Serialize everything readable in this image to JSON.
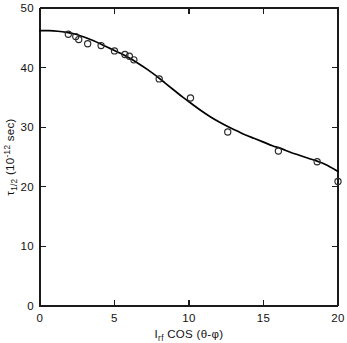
{
  "chart_data": {
    "type": "scatter",
    "title": "",
    "xlabel": "I_rf COS (θ-φ)",
    "xlabel_parts": {
      "main1": "I",
      "sub1": "rf",
      "main2": " COS (θ-φ)"
    },
    "ylabel": "τ_1/2 (10^-12 sec)",
    "ylabel_parts": {
      "main1": "τ",
      "sub1": "1/2",
      "main2": " (10",
      "sup1": "-12",
      "main3": " sec)"
    },
    "xlim": [
      0,
      20
    ],
    "ylim": [
      0,
      50
    ],
    "xticks": [
      0,
      5,
      10,
      15,
      20
    ],
    "xtick_labels": [
      "0",
      "5",
      "10",
      "15",
      "20"
    ],
    "yticks": [
      0,
      10,
      20,
      30,
      40,
      50
    ],
    "ytick_labels": [
      "0",
      "10",
      "20",
      "30",
      "40",
      "50"
    ],
    "grid": false,
    "legend": false,
    "axis_color": "#1a1a1a",
    "curve_color": "#000000",
    "marker_color": "#2b2b2b",
    "marker": "open-circle",
    "series": [
      {
        "name": "measured",
        "type": "scatter",
        "points": [
          {
            "x": 1.9,
            "y": 45.6
          },
          {
            "x": 2.4,
            "y": 45.2
          },
          {
            "x": 2.6,
            "y": 44.7
          },
          {
            "x": 3.2,
            "y": 44.0
          },
          {
            "x": 4.1,
            "y": 43.7
          },
          {
            "x": 5.0,
            "y": 42.8
          },
          {
            "x": 5.7,
            "y": 42.2
          },
          {
            "x": 6.0,
            "y": 41.9
          },
          {
            "x": 6.3,
            "y": 41.3
          },
          {
            "x": 8.0,
            "y": 38.1
          },
          {
            "x": 10.1,
            "y": 34.9
          },
          {
            "x": 12.6,
            "y": 29.2
          },
          {
            "x": 16.0,
            "y": 26.0
          },
          {
            "x": 18.6,
            "y": 24.2
          },
          {
            "x": 20.0,
            "y": 20.9
          }
        ]
      },
      {
        "name": "fit",
        "type": "line",
        "points": [
          {
            "x": 0.0,
            "y": 46.2
          },
          {
            "x": 0.6,
            "y": 46.2
          },
          {
            "x": 1.2,
            "y": 46.1
          },
          {
            "x": 1.8,
            "y": 45.9
          },
          {
            "x": 2.4,
            "y": 45.6
          },
          {
            "x": 3.0,
            "y": 45.1
          },
          {
            "x": 3.6,
            "y": 44.5
          },
          {
            "x": 4.2,
            "y": 43.8
          },
          {
            "x": 4.8,
            "y": 43.1
          },
          {
            "x": 5.4,
            "y": 42.4
          },
          {
            "x": 6.0,
            "y": 41.6
          },
          {
            "x": 6.6,
            "y": 40.7
          },
          {
            "x": 7.2,
            "y": 39.7
          },
          {
            "x": 7.8,
            "y": 38.6
          },
          {
            "x": 8.4,
            "y": 37.4
          },
          {
            "x": 9.0,
            "y": 36.2
          },
          {
            "x": 9.6,
            "y": 35.0
          },
          {
            "x": 10.2,
            "y": 33.9
          },
          {
            "x": 10.8,
            "y": 32.8
          },
          {
            "x": 11.4,
            "y": 31.8
          },
          {
            "x": 12.0,
            "y": 30.9
          },
          {
            "x": 12.6,
            "y": 30.1
          },
          {
            "x": 13.2,
            "y": 29.4
          },
          {
            "x": 13.8,
            "y": 28.7
          },
          {
            "x": 14.4,
            "y": 28.1
          },
          {
            "x": 15.0,
            "y": 27.5
          },
          {
            "x": 15.6,
            "y": 26.9
          },
          {
            "x": 16.2,
            "y": 26.4
          },
          {
            "x": 16.8,
            "y": 25.8
          },
          {
            "x": 17.4,
            "y": 25.3
          },
          {
            "x": 18.0,
            "y": 24.8
          },
          {
            "x": 18.6,
            "y": 24.3
          },
          {
            "x": 19.2,
            "y": 23.7
          },
          {
            "x": 20.0,
            "y": 22.6
          }
        ]
      }
    ]
  }
}
